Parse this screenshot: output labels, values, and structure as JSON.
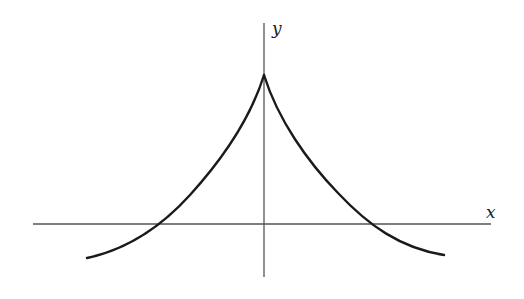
{
  "figure": {
    "type": "function-graph",
    "axes": {
      "x_label": "x",
      "y_label": "y"
    },
    "colors": {
      "axis": "#555555",
      "curve": "#1a1a1a",
      "background": "#ffffff"
    }
  }
}
